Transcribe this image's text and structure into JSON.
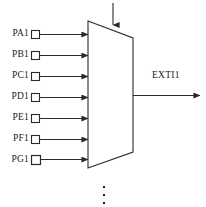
{
  "figure": {
    "line_color": "#2b2b2b",
    "text_color": "#1a1a1a",
    "background": "#ffffff",
    "cropped_top_text": "",
    "ellipsis_glyph": "vertical-ellipsis",
    "control_arrow": "downward-arrow-into-mux-top",
    "mux": {
      "shape": "trapezoid",
      "left_x": 88,
      "right_x": 133,
      "top_left_y": 21,
      "top_right_y": 38,
      "bottom_left_y": 168,
      "bottom_right_y": 152
    }
  },
  "inputs": [
    {
      "label": "PA1",
      "y": 34
    },
    {
      "label": "PB1",
      "y": 55
    },
    {
      "label": "PC1",
      "y": 76
    },
    {
      "label": "PD1",
      "y": 97
    },
    {
      "label": "PE1",
      "y": 118
    },
    {
      "label": "PF1",
      "y": 139
    },
    {
      "label": "PG1",
      "y": 159
    }
  ],
  "output": {
    "label": "EXTI1",
    "label_x": 152,
    "label_y": 72,
    "line_y": 95,
    "line_from_x": 133,
    "line_to_x": 200
  }
}
